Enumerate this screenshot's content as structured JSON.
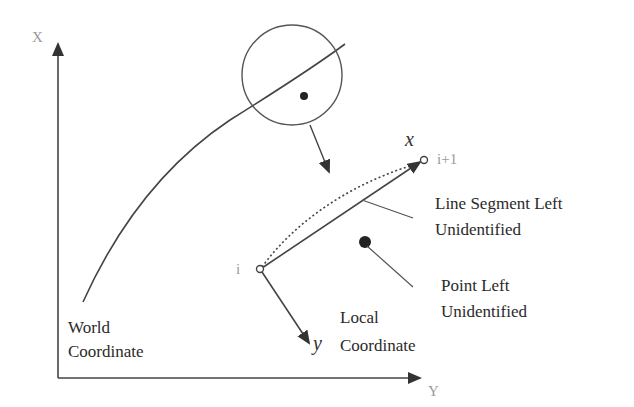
{
  "diagram": {
    "type": "coordinate-transformation-figure",
    "axes": {
      "vertical_label": "X",
      "horizontal_label": "Y"
    },
    "labels": {
      "world_line1": "World",
      "world_line2": "Coordinate",
      "local_line1": "Local",
      "local_line2": "Coordinate",
      "local_x": "x",
      "local_y": "y",
      "point_i": "i",
      "point_i1": "i+1",
      "segment_line1": "Line Segment Left",
      "segment_line2": "Unidentified",
      "point_line1": "Point Left",
      "point_line2": "Unidentified"
    },
    "colors": {
      "stroke": "#3a3a3a",
      "light_text": "#9a9a9a",
      "background": "#ffffff"
    }
  }
}
